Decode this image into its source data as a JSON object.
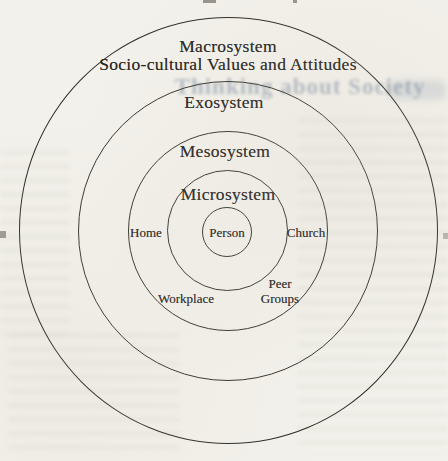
{
  "figure": {
    "type": "concentric-circle ecological systems diagram",
    "rings": [
      {
        "name": "Macrosystem",
        "subtitle": "Socio-cultural Values and Attitudes"
      },
      {
        "name": "Exosystem"
      },
      {
        "name": "Mesosystem"
      },
      {
        "name": "Microsystem"
      }
    ],
    "center": {
      "label": "Person"
    },
    "contexts": [
      {
        "label": "Home",
        "position": "left"
      },
      {
        "label": "Church",
        "position": "right"
      },
      {
        "label": "Workplace",
        "position": "bottom-left"
      },
      {
        "label": "Peer Groups",
        "position": "bottom-right"
      }
    ]
  },
  "ghost": {
    "bleed_title": "Thinking about Society"
  },
  "colors": {
    "paper": "#f3f1eb",
    "ink": "#26241f",
    "line": "#35332d",
    "bleed_ink": "#7a8ba2"
  }
}
